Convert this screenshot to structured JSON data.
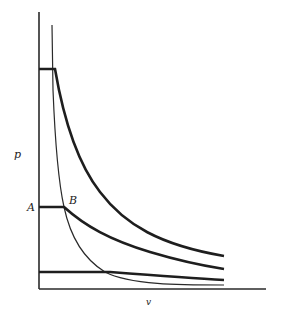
{
  "diagram": {
    "type": "p-v isotherm diagram",
    "axes": {
      "y_label": "p",
      "x_label": "v"
    },
    "points": [
      {
        "name": "A",
        "label": "A"
      },
      {
        "name": "B",
        "label": "B"
      }
    ],
    "curves": [
      {
        "name": "upper-isotherm",
        "style": "thick",
        "description": "horizontal segment at top then hyperbolic decay"
      },
      {
        "name": "middle-isotherm",
        "style": "thick",
        "description": "horizontal segment A-B then decay"
      },
      {
        "name": "lower-isotherm",
        "style": "thick",
        "description": "nearly horizontal line near bottom"
      },
      {
        "name": "boundary-curve",
        "style": "thin",
        "description": "steep thin curve through B approaching v-axis"
      }
    ],
    "colors": {
      "line": "#1e1e1e",
      "background": "#ffffff"
    }
  }
}
